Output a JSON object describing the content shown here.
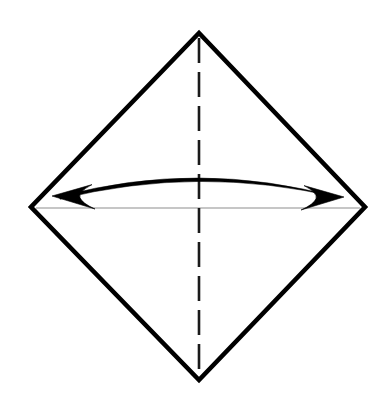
{
  "figure": {
    "caption": "Square rotated 45 degrees with vertical dashed fold line, horizontal reference line, and a curved double-headed arrow between the left and right corners.",
    "canvas": {
      "width": 385,
      "height": 397,
      "background": "#ffffff"
    },
    "colors": {
      "outline": "#000000",
      "dashed_fold": "#1a1a1a",
      "reference_line": "#b3b3b3",
      "arrow": "#000000",
      "background": "#ffffff"
    },
    "shapes": {
      "diamond": {
        "name": "diamond-outline",
        "kind": "polygon",
        "stroke_width": 4.6,
        "vertices": [
          {
            "label": "top",
            "x": 199,
            "y": 33
          },
          {
            "label": "right",
            "x": 365,
            "y": 207
          },
          {
            "label": "bottom",
            "x": 199,
            "y": 380
          },
          {
            "label": "left",
            "x": 31,
            "y": 207
          }
        ]
      },
      "vertical_fold": {
        "name": "vertical-dashed-fold-line",
        "kind": "dashed-line",
        "stroke_width": 2.6,
        "dash_length": 25,
        "gap_length": 9,
        "x1": 199,
        "y1": 38,
        "x2": 199,
        "y2": 375
      },
      "horizontal_reference": {
        "name": "horizontal-reference-line",
        "kind": "line",
        "stroke_width": 1.6,
        "x1": 36,
        "y1": 208,
        "x2": 360,
        "y2": 208
      },
      "curved_arrow": {
        "name": "curved-double-headed-arrow",
        "kind": "quadratic-arc",
        "stroke_width": 2.2,
        "start": {
          "x": 56,
          "y": 197
        },
        "control": {
          "x": 199,
          "y": 159
        },
        "end": {
          "x": 340,
          "y": 198
        },
        "arrowheads": [
          {
            "label": "left-arrowhead",
            "tip_x": 52,
            "tip_y": 196,
            "direction": "left"
          },
          {
            "label": "right-arrowhead",
            "tip_x": 344,
            "tip_y": 197,
            "direction": "right"
          }
        ]
      }
    }
  }
}
